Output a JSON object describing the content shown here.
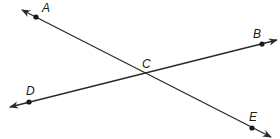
{
  "diagram": {
    "type": "intersecting-lines",
    "stroke_color": "#2a2a2a",
    "background": "#ffffff",
    "lines": [
      {
        "name": "line-AE",
        "from": "A",
        "to": "E",
        "x1": 22,
        "y1": 10,
        "x2": 271,
        "y2": 137
      },
      {
        "name": "line-DB",
        "from": "D",
        "to": "B",
        "x1": 10,
        "y1": 107,
        "x2": 277,
        "y2": 40
      }
    ],
    "points": [
      {
        "label": "A",
        "x": 36,
        "y": 17,
        "lx": 42,
        "ly": 12
      },
      {
        "label": "B",
        "x": 262,
        "y": 44,
        "lx": 253,
        "ly": 38
      },
      {
        "label": "C",
        "x": 143,
        "y": 73,
        "lx": 142,
        "ly": 68,
        "dot": false
      },
      {
        "label": "D",
        "x": 29,
        "y": 102,
        "lx": 26,
        "ly": 95
      },
      {
        "label": "E",
        "x": 252,
        "y": 128,
        "lx": 249,
        "ly": 121
      }
    ]
  }
}
